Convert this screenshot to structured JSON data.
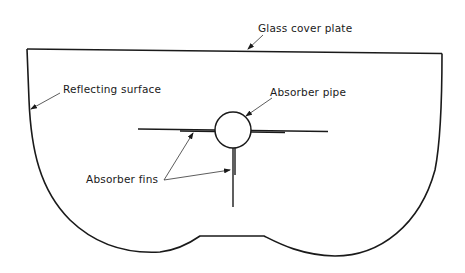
{
  "diagram": {
    "title": "",
    "labels": {
      "glass_cover_plate": "Glass cover plate",
      "reflecting_surface": "Reflecting surface",
      "absorber_pipe": "Absorber pipe",
      "absorber_fins": "Absorber fins"
    },
    "components": [
      {
        "id": "glass-cover-plate",
        "label": "Glass cover plate"
      },
      {
        "id": "reflecting-surface",
        "label": "Reflecting surface"
      },
      {
        "id": "absorber-pipe",
        "label": "Absorber pipe"
      },
      {
        "id": "absorber-fins",
        "label": "Absorber fins",
        "count": 3
      }
    ],
    "colors": {
      "line": "#1a1a1a",
      "background": "#ffffff"
    }
  }
}
